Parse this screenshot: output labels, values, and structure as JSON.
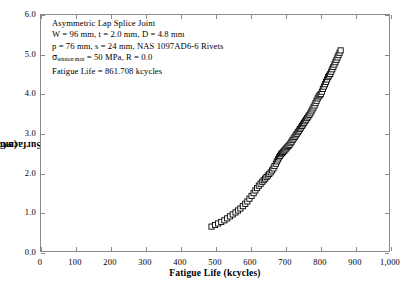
{
  "chart_data": {
    "type": "scatter",
    "title": "",
    "xlabel": "Fatigue Life (kcycles)",
    "ylabel": "Faying Surface Crack Length, c_b (mm)",
    "ylabel_main": "Faying Surface Crack Length, c",
    "ylabel_sub": "b",
    "ylabel_unit": " (mm)",
    "xlim": [
      0,
      1000
    ],
    "ylim": [
      0.0,
      6.0
    ],
    "xticks": [
      0,
      100,
      200,
      300,
      400,
      500,
      600,
      700,
      800,
      900,
      1000
    ],
    "xticklabels": [
      "0",
      "100",
      "200",
      "300",
      "400",
      "500",
      "600",
      "700",
      "800",
      "900",
      "1,000"
    ],
    "yticks": [
      0.0,
      1.0,
      2.0,
      3.0,
      4.0,
      5.0,
      6.0
    ],
    "yticklabels": [
      "0.0",
      "1.0",
      "2.0",
      "3.0",
      "4.0",
      "5.0",
      "6.0"
    ],
    "grid": false,
    "legend": false,
    "marker": "open-square",
    "marker_color": "#000000",
    "series": [
      {
        "name": "Faying surface crack growth",
        "x": [
          490,
          500,
          509,
          518,
          527,
          535,
          543,
          551,
          559,
          566,
          573,
          580,
          587,
          593,
          599,
          605,
          611,
          616,
          621,
          626,
          631,
          636,
          640,
          644,
          648,
          652,
          656,
          660,
          664,
          668,
          671,
          675,
          678,
          681,
          684,
          687,
          690,
          693,
          696,
          699,
          702,
          705,
          708,
          711,
          714,
          717,
          720,
          723,
          726,
          729,
          732,
          735,
          738,
          741,
          744,
          747,
          750,
          753,
          756,
          759,
          762,
          765,
          768,
          771,
          774,
          777,
          780,
          783,
          786,
          789,
          792,
          795,
          798,
          801,
          804,
          807,
          810,
          813,
          816,
          819,
          822,
          825,
          828,
          831,
          834,
          837,
          840,
          843,
          846,
          849,
          852,
          855,
          858,
          861
        ],
        "y": [
          0.62,
          0.66,
          0.7,
          0.74,
          0.78,
          0.83,
          0.88,
          0.93,
          0.98,
          1.03,
          1.08,
          1.14,
          1.2,
          1.26,
          1.33,
          1.4,
          1.47,
          1.54,
          1.6,
          1.66,
          1.71,
          1.76,
          1.8,
          1.84,
          1.88,
          1.92,
          1.96,
          2.0,
          2.05,
          2.1,
          2.16,
          2.22,
          2.28,
          2.33,
          2.38,
          2.42,
          2.46,
          2.49,
          2.52,
          2.55,
          2.58,
          2.61,
          2.64,
          2.67,
          2.7,
          2.74,
          2.78,
          2.82,
          2.86,
          2.9,
          2.94,
          2.98,
          3.02,
          3.06,
          3.1,
          3.14,
          3.18,
          3.22,
          3.26,
          3.3,
          3.34,
          3.38,
          3.42,
          3.46,
          3.5,
          3.55,
          3.6,
          3.65,
          3.7,
          3.76,
          3.82,
          3.88,
          3.93,
          3.96,
          3.99,
          4.05,
          4.12,
          4.18,
          4.24,
          4.3,
          4.36,
          4.42,
          4.46,
          4.5,
          4.56,
          4.62,
          4.68,
          4.74,
          4.8,
          4.86,
          4.92,
          4.98,
          5.04,
          5.1
        ]
      }
    ]
  },
  "annotation": {
    "line1": "Asymmetric Lap Splice Joint",
    "line2": "W = 96 mm, t = 2.0 mm, D = 4.8 mm",
    "line3": "p = 76 mm, s = 24 mm, NAS 1097AD6-6 Rivets",
    "line4_sigma": "σ",
    "line4_sub": "tension max",
    "line4_rest": " = 50 MPa, R = 0.0",
    "line5": "Fatigue Life = 861.708 kcycles"
  }
}
